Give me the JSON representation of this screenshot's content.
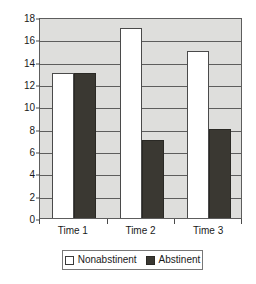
{
  "chart_data": {
    "type": "bar",
    "title": "",
    "subtitle": "",
    "xlabel": "",
    "ylabel": "",
    "categories": [
      "Time 1",
      "Time 2",
      "Time 3"
    ],
    "series": [
      {
        "name": "Nonabstinent",
        "color": "#ffffff",
        "values": [
          13,
          17,
          15
        ]
      },
      {
        "name": "Abstinent",
        "color": "#3a3832",
        "values": [
          13,
          7,
          8
        ]
      }
    ],
    "ylim": [
      0,
      18
    ],
    "ytick_labels": [
      "0",
      "2",
      "4",
      "6",
      "8",
      "10",
      "12",
      "14",
      "16",
      "18"
    ],
    "ytick_values": [
      0,
      2,
      4,
      6,
      8,
      10,
      12,
      14,
      16,
      18
    ],
    "grid": true,
    "grid_axis": "y",
    "legend_position": "bottom",
    "plot_background": "#dededc",
    "gridline_color": "#5d5d5d",
    "axis_color": "#4a4a4a"
  },
  "legend": {
    "entries": [
      {
        "label": "Nonabstinent",
        "swatch": "nonabstinent"
      },
      {
        "label": "Abstinent",
        "swatch": "abstinent"
      }
    ]
  }
}
